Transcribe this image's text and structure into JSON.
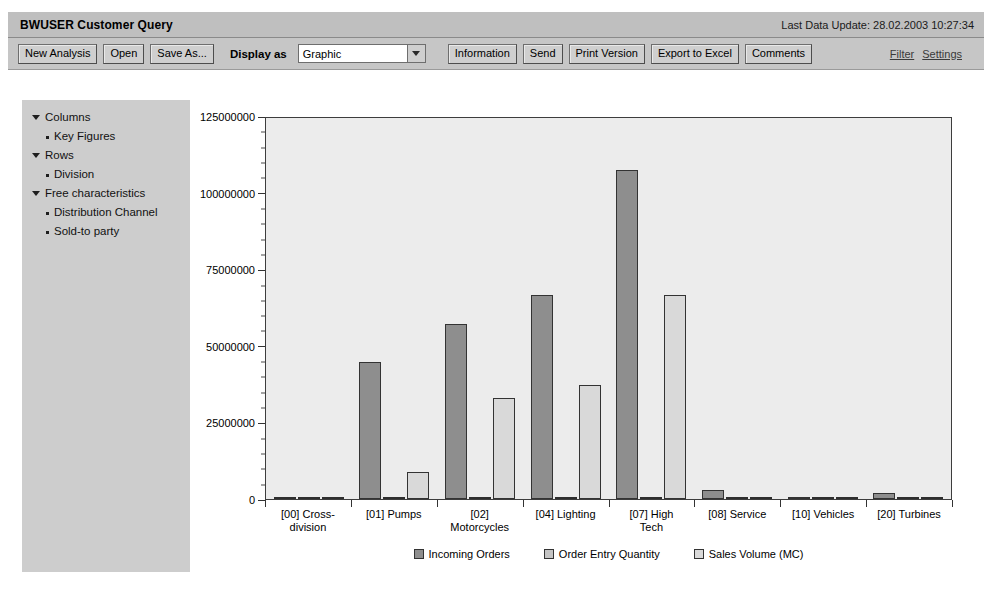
{
  "header": {
    "title": "BWUSER Customer Query",
    "last_update_label": "Last Data Update: 28.02.2003 10:27:34"
  },
  "toolbar": {
    "new_analysis": "New Analysis",
    "open": "Open",
    "save_as": "Save As...",
    "display_as_label": "Display as",
    "display_as_value": "Graphic",
    "information": "Information",
    "send": "Send",
    "print_version": "Print Version",
    "export_to_excel": "Export to Excel",
    "comments": "Comments",
    "filter_link": "Filter",
    "settings_link": "Settings"
  },
  "sidebar": {
    "groups": [
      {
        "label": "Columns",
        "items": [
          "Key Figures"
        ]
      },
      {
        "label": "Rows",
        "items": [
          "Division"
        ]
      },
      {
        "label": "Free characteristics",
        "items": [
          "Distribution Channel",
          "Sold-to party"
        ]
      }
    ]
  },
  "chart_data": {
    "type": "bar",
    "title": "",
    "xlabel": "",
    "ylabel": "",
    "ylim": [
      0,
      125000000
    ],
    "yticks": [
      0,
      25000000,
      50000000,
      75000000,
      100000000,
      125000000
    ],
    "ytick_labels": [
      "0",
      "25000000",
      "50000000",
      "75000000",
      "100000000",
      "125000000"
    ],
    "grid": false,
    "legend_position": "bottom",
    "categories": [
      "[00] Cross-division",
      "[01] Pumps",
      "[02] Motorcycles",
      "[04] Lighting",
      "[07] High Tech",
      "[08] Service",
      "[10] Vehicles",
      "[20] Turbines"
    ],
    "category_lines": [
      [
        "[00] Cross-",
        "division"
      ],
      [
        "[01] Pumps"
      ],
      [
        "[02]",
        "Motorcycles"
      ],
      [
        "[04] Lighting"
      ],
      [
        "[07] High",
        "Tech"
      ],
      [
        "[08] Service"
      ],
      [
        "[10] Vehicles"
      ],
      [
        "[20] Turbines"
      ]
    ],
    "series": [
      {
        "name": "Incoming Orders",
        "color": "#8e8e8e",
        "values": [
          0,
          45000000,
          57500000,
          67000000,
          108000000,
          2800000,
          300000,
          1900000
        ]
      },
      {
        "name": "Order Entry Quantity",
        "color": "#c4c4c4",
        "values": [
          0,
          0,
          0,
          0,
          0,
          0,
          0,
          0
        ]
      },
      {
        "name": "Sales Volume (MC)",
        "color": "#d9d9d9",
        "values": [
          0,
          9000000,
          33000000,
          37500000,
          67000000,
          0,
          0,
          0
        ]
      }
    ]
  },
  "ghost_text": "screen to this message is now the graphic shows the from the you can be defined in the settings window they are configured with data from the type of machine. Use the settings to report the key figures and the data in the analysis can be a whole in this report. For overview on the key figures in Analysis for the reporting of the overview. The data is selected and the report can be presented and the report key figures for the analysis to the details."
}
